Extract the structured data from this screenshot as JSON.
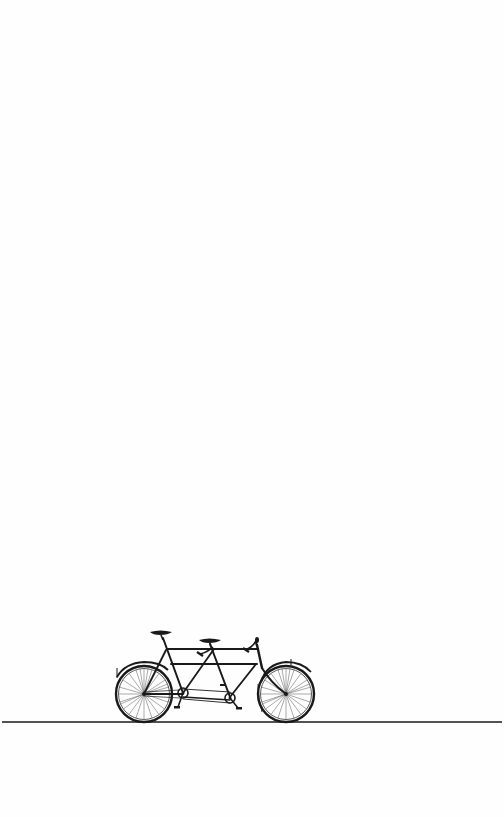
{
  "page": {
    "background": "#fefefe",
    "ink_color": "#1a1a1a"
  },
  "illustration": {
    "subject": "tandem-bicycle",
    "description": "Vintage engraving-style tandem bicycle standing on a horizontal ground line",
    "ground_line": {
      "x1": 2,
      "x2": 502,
      "y": 722
    },
    "rear_wheel": {
      "cx": 144,
      "cy": 694,
      "r": 28
    },
    "front_wheel": {
      "cx": 286,
      "cy": 694,
      "r": 28
    },
    "rear_saddle": {
      "x": 150,
      "y": 631,
      "w": 22
    },
    "front_saddle": {
      "x": 199,
      "y": 639,
      "w": 22
    },
    "handlebar": {
      "x": 257,
      "y": 641
    }
  }
}
